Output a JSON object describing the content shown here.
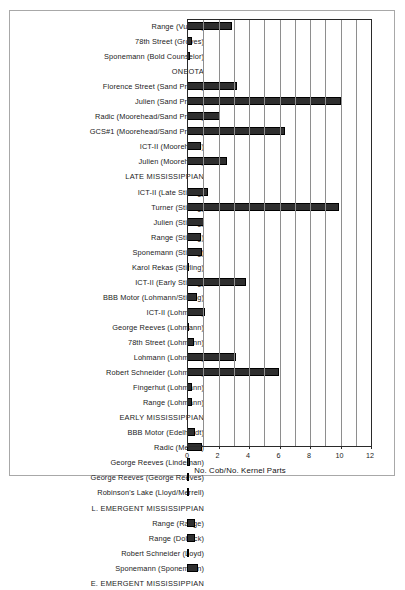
{
  "chart_data": {
    "type": "bar",
    "orientation": "horizontal",
    "title": "",
    "xlabel": "No. Cob/No. Kernel Parts",
    "ylabel": "",
    "xlim": [
      0,
      12
    ],
    "xticks": [
      0,
      2,
      4,
      6,
      8,
      10,
      12
    ],
    "gridlines_every": 1,
    "grid": true,
    "legend": null,
    "bar_color": "#2f2f2f",
    "categories": [
      "Range (Vulcan)",
      "78th Street (Groves)",
      "Sponemann (Bold Counselor)",
      "ONEOTA",
      "Florence Street (Sand Prairie)",
      "Julien (Sand Prairie)",
      "Radic (Moorehead/Sand Prairie)",
      "GCS#1 (Moorehead/Sand Prairie)",
      "ICT-II (Moorehead)",
      "Julien (Moorehead)",
      "LATE MISSISSIPPIAN",
      "ICT-II (Late Stirling)",
      "Turner (Stirling)",
      "Julien (Stirling)",
      "Range (Stirling)",
      "Sponemann (Stirling)",
      "Karol Rekas (Stirling)",
      "ICT-II (Early Stirling)",
      "BBB Motor (Lohmann/Stirling)",
      "ICT-II (Lohmann)",
      "George Reeves (Lohmann)",
      "78th Street (Lohmann)",
      "Lohmann (Lohmann)",
      "Robert Schneider (Lohmann)",
      "Fingerhut (Lohmann)",
      "Range (Lohmann)",
      "EARLY MISSISSIPPIAN",
      "BBB Motor (Edelhardt)",
      "Radic (Merrell)",
      "George Reeves (Lindeman)",
      "George Reeves (George Reeves)",
      "Robinson's Lake (Lloyd/Merrell)",
      "L. EMERGENT MISSISSIPPIAN",
      "Range (Range)",
      "Range (Dohack)",
      "Robert Schneider (Loyd)",
      "Sponemann (Sponemann)",
      "E. EMERGENT MISSISSIPPIAN"
    ],
    "is_era_header": [
      false,
      false,
      false,
      true,
      false,
      false,
      false,
      false,
      false,
      false,
      true,
      false,
      false,
      false,
      false,
      false,
      false,
      false,
      false,
      false,
      false,
      false,
      false,
      false,
      false,
      false,
      true,
      false,
      false,
      false,
      false,
      false,
      true,
      false,
      false,
      false,
      false,
      true
    ],
    "values": [
      2.95,
      0.3,
      0.18,
      0,
      3.3,
      10.1,
      2.15,
      6.4,
      0.95,
      2.6,
      0,
      1.35,
      9.95,
      1.1,
      0.95,
      1.0,
      0.15,
      3.85,
      0.65,
      1.15,
      0.1,
      0.45,
      3.2,
      6.0,
      0.3,
      0.35,
      0,
      0.55,
      1.0,
      0.2,
      0.15,
      0.1,
      0,
      0.55,
      0.5,
      0.1,
      0.75,
      0
    ]
  }
}
